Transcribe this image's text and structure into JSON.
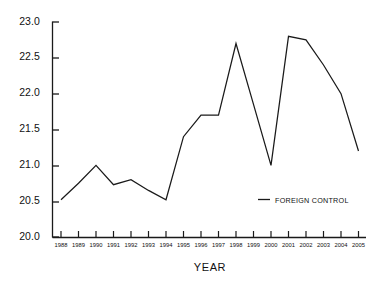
{
  "chart_data": {
    "type": "line",
    "title": "",
    "xlabel": "YEAR",
    "ylabel": "",
    "categories": [
      "1988",
      "1989",
      "1990",
      "1991",
      "1992",
      "1993",
      "1994",
      "1995",
      "1996",
      "1997",
      "1998",
      "1999",
      "2000",
      "2001",
      "2002",
      "2003",
      "2004",
      "2005"
    ],
    "x": [
      1988,
      1989,
      1990,
      1991,
      1992,
      1993,
      1994,
      1995,
      1996,
      1997,
      1998,
      1999,
      2000,
      2001,
      2002,
      2003,
      2004,
      2005
    ],
    "series": [
      {
        "name": "FOREIGN CONTROL",
        "values": [
          20.52,
          20.75,
          21.0,
          20.73,
          20.8,
          20.65,
          20.52,
          21.4,
          21.7,
          21.7,
          22.7,
          21.85,
          21.0,
          22.8,
          22.75,
          22.4,
          22.0,
          21.2
        ]
      }
    ],
    "ylim": [
      20.0,
      23.0
    ],
    "yticks": [
      20.0,
      20.5,
      21.0,
      21.5,
      22.0,
      22.5,
      23.0
    ],
    "ytick_labels": [
      "20.0",
      "20.5",
      "21.0",
      "21.5",
      "22.0",
      "22.5",
      "23.0"
    ],
    "xlim": [
      1988,
      2005
    ],
    "grid": false,
    "legend_position": "inside-lower-right",
    "line_color": "#1a1a1a"
  },
  "axes": {
    "x_title": "YEAR",
    "y_tick_labels": [
      "23.0",
      "22.5",
      "22.0",
      "21.5",
      "21.0",
      "20.5",
      "20.0"
    ],
    "x_tick_labels": [
      "1988",
      "1989",
      "1990",
      "1991",
      "1992",
      "1993",
      "1994",
      "1995",
      "1996",
      "1997",
      "1998",
      "1999",
      "2000",
      "2001",
      "2002",
      "2003",
      "2004",
      "2005"
    ]
  },
  "legend": {
    "entries": [
      {
        "label": "FOREIGN CONTROL",
        "color": "#1a1a1a"
      }
    ]
  }
}
